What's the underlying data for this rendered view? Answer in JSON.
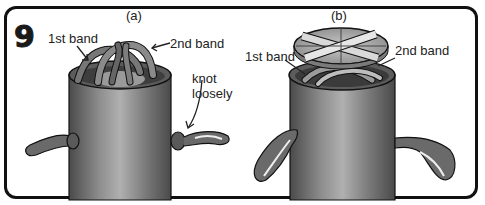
{
  "step": {
    "number": "9"
  },
  "panels": [
    {
      "id": "a",
      "caption": "(a)",
      "labels": {
        "first_band": "1st band",
        "second_band": "2nd band",
        "knot": "knot\nloosely",
        "knot_line1": "knot",
        "knot_line2": "loosely"
      }
    },
    {
      "id": "b",
      "caption": "(b)",
      "labels": {
        "first_band": "1st band",
        "second_band": "2nd band"
      }
    }
  ],
  "colors": {
    "outline": "#111111",
    "can_dark": "#5a5a5a",
    "can_light": "#a8a8a8",
    "band": "#6e6e6e",
    "background": "#ffffff"
  }
}
